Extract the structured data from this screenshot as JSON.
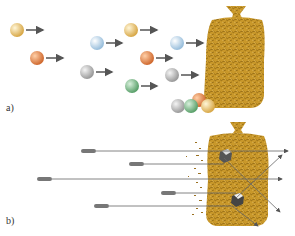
{
  "panels": {
    "a": {
      "label": "a)",
      "balls": [
        {
          "cx": 17,
          "cy": 30,
          "color": "#e8c46a"
        },
        {
          "cx": 37,
          "cy": 58,
          "color": "#e0824a"
        },
        {
          "cx": 97,
          "cy": 43,
          "color": "#b8d4ea"
        },
        {
          "cx": 131,
          "cy": 30,
          "color": "#e8c46a"
        },
        {
          "cx": 87,
          "cy": 72,
          "color": "#b8b8b8"
        },
        {
          "cx": 147,
          "cy": 58,
          "color": "#e0824a"
        },
        {
          "cx": 132,
          "cy": 86,
          "color": "#7fb88a"
        },
        {
          "cx": 177,
          "cy": 43,
          "color": "#c4dcef"
        },
        {
          "cx": 172,
          "cy": 75,
          "color": "#b8b8b8"
        }
      ],
      "pile": [
        {
          "cx": 178,
          "cy": 106,
          "color": "#b8b8b8"
        },
        {
          "cx": 191,
          "cy": 106,
          "color": "#7fb88a"
        },
        {
          "cx": 199,
          "cy": 100,
          "color": "#e0a070"
        },
        {
          "cx": 208,
          "cy": 106,
          "color": "#ecc890"
        }
      ]
    },
    "b": {
      "label": "b)"
    }
  },
  "colors": {
    "bag": "#c9982a",
    "bag_dark": "#a87a1a",
    "arrow": "#555555"
  }
}
